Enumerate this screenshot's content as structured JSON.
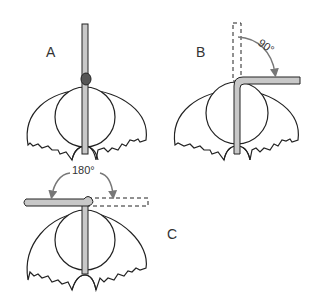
{
  "diagram": {
    "panels": [
      {
        "id": "A",
        "label": "A",
        "description": "Straight pin inserted vertically through structure"
      },
      {
        "id": "B",
        "label": "B",
        "description": "Pin bent 90 degrees",
        "angle_label": "90°"
      },
      {
        "id": "C",
        "label": "C",
        "description": "Pin bent 180 degrees",
        "angle_label": "180°"
      }
    ],
    "colors": {
      "stroke": "#222222",
      "rod_fill": "#c8c8c8",
      "arrow": "#777777",
      "background": "#ffffff"
    }
  }
}
